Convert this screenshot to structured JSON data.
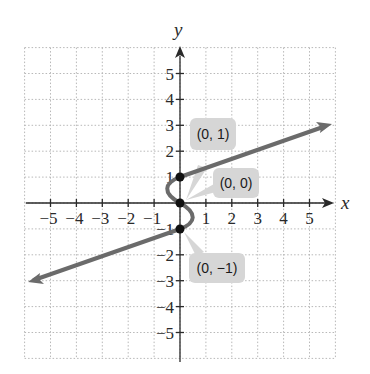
{
  "chart_data": {
    "type": "line",
    "title": "",
    "xlabel": "x",
    "ylabel": "y",
    "xlim": [
      -6,
      6
    ],
    "ylim": [
      -6,
      6
    ],
    "grid": true,
    "x_ticks": [
      "−5",
      "−4",
      "−3",
      "−2",
      "−1",
      "1",
      "2",
      "3",
      "4",
      "5"
    ],
    "y_ticks": [
      "5",
      "4",
      "3",
      "2",
      "1",
      "−1",
      "−2",
      "−3",
      "−4",
      "−5"
    ],
    "series": [
      {
        "name": "relation (x as function of y)",
        "points": [
          [
            -6,
            -3
          ],
          [
            0,
            -1
          ],
          [
            0.5,
            -0.5
          ],
          [
            0,
            0
          ],
          [
            -0.5,
            0.5
          ],
          [
            0,
            1
          ],
          [
            6,
            3
          ]
        ],
        "color": "#6b6b6b",
        "arrows": [
          "both-ends"
        ]
      }
    ],
    "marked_points": [
      {
        "x": 0,
        "y": 1,
        "label": "(0, 1)"
      },
      {
        "x": 0,
        "y": 0,
        "label": "(0, 0)"
      },
      {
        "x": 0,
        "y": -1,
        "label": "(0, −1)"
      }
    ],
    "colors": {
      "curve": "#6b6b6b",
      "points": "#111111",
      "bubble": "#d6d6d6",
      "grid": "#b8b8b8",
      "axis": "#2a2a2a"
    }
  }
}
